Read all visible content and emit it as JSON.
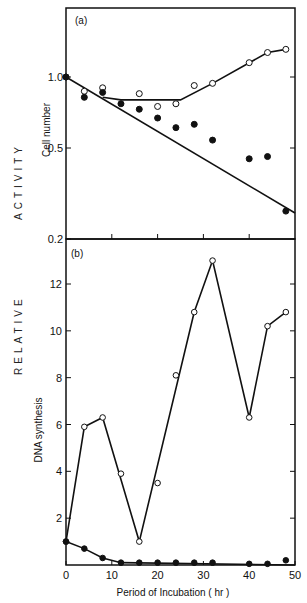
{
  "figure": {
    "left_label_top": "ACTIVITY",
    "left_label_bottom": "RELATIVE",
    "xlabel": "Period of Incubation ( hr )"
  },
  "chart_data": [
    {
      "panel": "(a)",
      "type": "scatter",
      "ylabel": "Cell number",
      "yscale": "log",
      "ylim": [
        0.2,
        1.5
      ],
      "yticks": [
        0.2,
        0.5,
        1.0
      ],
      "ytick_labels": [
        "0.2",
        "0.5",
        "1.0"
      ],
      "xlim": [
        0,
        50
      ],
      "xticks": [
        0,
        10,
        20,
        30,
        40,
        50
      ],
      "grid": false,
      "series": [
        {
          "name": "open circles",
          "marker": "open",
          "x": [
            0,
            4,
            8,
            16,
            20,
            24,
            28,
            32,
            40,
            44,
            48
          ],
          "y": [
            1.0,
            0.87,
            0.9,
            0.85,
            0.75,
            0.77,
            0.92,
            0.94,
            1.15,
            1.27,
            1.31
          ]
        },
        {
          "name": "filled circles",
          "marker": "filled",
          "x": [
            0,
            4,
            8,
            12,
            16,
            20,
            24,
            28,
            32,
            40,
            44,
            48
          ],
          "y": [
            1.0,
            0.82,
            0.86,
            0.77,
            0.73,
            0.67,
            0.61,
            0.63,
            0.54,
            0.45,
            0.46,
            0.27
          ]
        }
      ],
      "fit_lines": [
        {
          "name": "open fit",
          "x": [
            8,
            12,
            16,
            20,
            25,
            32,
            44,
            48
          ],
          "y": [
            0.82,
            0.8,
            0.8,
            0.8,
            0.8,
            0.94,
            1.27,
            1.31
          ]
        },
        {
          "name": "filled fit",
          "x": [
            0,
            50
          ],
          "y": [
            1.0,
            0.265
          ]
        }
      ]
    },
    {
      "panel": "(b)",
      "type": "line",
      "ylabel": "DNA synthesis",
      "ylim": [
        0,
        14
      ],
      "yticks": [
        2,
        4,
        6,
        8,
        10,
        12
      ],
      "ytick_labels": [
        "2",
        "4",
        "6",
        "8",
        "10",
        "12"
      ],
      "xlim": [
        0,
        50
      ],
      "xticks": [
        0,
        10,
        20,
        30,
        40,
        50
      ],
      "xtick_labels": [
        "0",
        "10",
        "20",
        "30",
        "40",
        "50"
      ],
      "xlabel": "Period of Incubation ( hr )",
      "grid": false,
      "series": [
        {
          "name": "open circles",
          "marker": "open",
          "x": [
            0,
            4,
            8,
            12,
            16,
            20,
            24,
            28,
            32,
            40,
            44,
            48
          ],
          "y": [
            1.0,
            5.9,
            6.3,
            3.9,
            1.0,
            3.5,
            8.1,
            10.8,
            13.0,
            6.3,
            10.2,
            10.8
          ],
          "line_x": [
            0,
            4,
            8,
            16,
            28,
            32,
            40,
            44,
            48
          ],
          "line_y": [
            1.0,
            5.9,
            6.3,
            1.0,
            10.8,
            13.0,
            6.3,
            10.2,
            10.8
          ]
        },
        {
          "name": "filled circles",
          "marker": "filled",
          "x": [
            0,
            4,
            8,
            12,
            16,
            20,
            24,
            28,
            32,
            40,
            44,
            48
          ],
          "y": [
            1.0,
            0.7,
            0.3,
            0.1,
            0.1,
            0.1,
            0.1,
            0.1,
            0.1,
            0.05,
            0.05,
            0.2
          ],
          "line_x": [
            0,
            4,
            8,
            12,
            50
          ],
          "line_y": [
            1.0,
            0.7,
            0.3,
            0.1,
            0.0
          ]
        }
      ]
    }
  ]
}
